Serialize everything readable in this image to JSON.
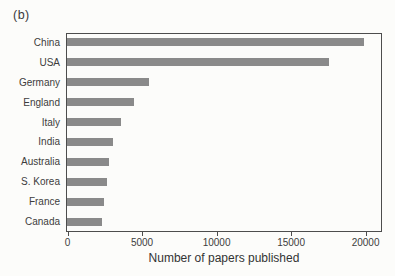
{
  "figure_label": "(b)",
  "colors": {
    "bar": "#8a8a8a",
    "axis": "#4d4d4d",
    "text": "#3d3d3d",
    "background": "#fcfcfa"
  },
  "chart_data": {
    "type": "bar",
    "orientation": "horizontal",
    "title": "",
    "categories": [
      "China",
      "USA",
      "Germany",
      "England",
      "Italy",
      "India",
      "Australia",
      "S. Korea",
      "France",
      "Canada"
    ],
    "values": [
      19900,
      17600,
      5500,
      4500,
      3650,
      3100,
      2800,
      2700,
      2500,
      2350
    ],
    "xlabel": "Number of papers published",
    "ylabel": "",
    "x_ticks": [
      0,
      5000,
      10000,
      15000,
      20000
    ],
    "x_tick_labels": [
      "0",
      "5000",
      "10000",
      "15000",
      "20000"
    ],
    "xlim": [
      0,
      21000
    ],
    "grid": false,
    "legend": null
  }
}
